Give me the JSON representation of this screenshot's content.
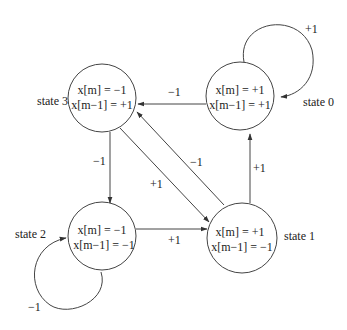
{
  "diagram": {
    "type": "state-transition",
    "states": [
      {
        "id": "state0",
        "name": "state 0",
        "line1": "x[m] = +1",
        "line2": "x[m−1] = +1"
      },
      {
        "id": "state1",
        "name": "state 1",
        "line1": "x[m] = +1",
        "line2": "x[m−1] = −1"
      },
      {
        "id": "state2",
        "name": "state 2",
        "line1": "x[m] = −1",
        "line2": "x[m−1] = −1"
      },
      {
        "id": "state3",
        "name": "state 3",
        "line1": "x[m] = −1",
        "line2": "x[m−1] = +1"
      }
    ],
    "transitions": [
      {
        "from": "state0",
        "to": "state0",
        "label": "+1"
      },
      {
        "from": "state0",
        "to": "state3",
        "label": "−1"
      },
      {
        "from": "state1",
        "to": "state0",
        "label": "+1"
      },
      {
        "from": "state1",
        "to": "state3",
        "label": "−1"
      },
      {
        "from": "state3",
        "to": "state1",
        "label": "+1"
      },
      {
        "from": "state3",
        "to": "state2",
        "label": "−1"
      },
      {
        "from": "state2",
        "to": "state1",
        "label": "+1"
      },
      {
        "from": "state2",
        "to": "state2",
        "label": "−1"
      }
    ]
  }
}
